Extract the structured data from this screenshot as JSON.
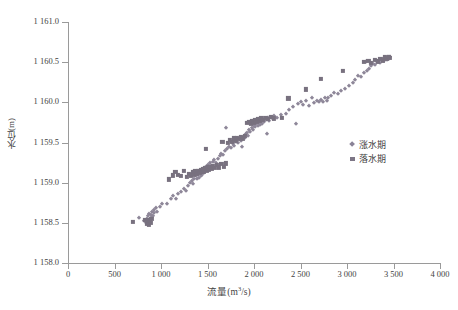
{
  "chart_data": {
    "type": "scatter",
    "title": "",
    "xlabel": "流量(m³/s)",
    "ylabel": "水位(m)",
    "xlim": [
      0,
      4000
    ],
    "ylim": [
      1158.0,
      1161.0
    ],
    "xticks": [
      "0",
      "500",
      "1 000",
      "1 500",
      "2 000",
      "2 500",
      "3 000",
      "3 500",
      "4 000"
    ],
    "xtick_values": [
      0,
      500,
      1000,
      1500,
      2000,
      2500,
      3000,
      3500,
      4000
    ],
    "yticks": [
      "1 158.0",
      "1 158.5",
      "1 159.0",
      "1 159.5",
      "1 160.0",
      "1 160.5",
      "1 161.0"
    ],
    "ytick_values": [
      1158.0,
      1158.5,
      1159.0,
      1159.5,
      1160.0,
      1160.5,
      1161.0
    ],
    "grid": false,
    "legend_position": "right-center",
    "series": [
      {
        "name": "涨水期",
        "marker": "diamond",
        "color": "#8e8799",
        "points": [
          [
            760,
            1158.56
          ],
          [
            820,
            1158.52
          ],
          [
            835,
            1158.5
          ],
          [
            848,
            1158.55
          ],
          [
            858,
            1158.52
          ],
          [
            862,
            1158.58
          ],
          [
            870,
            1158.61
          ],
          [
            876,
            1158.54
          ],
          [
            884,
            1158.53
          ],
          [
            890,
            1158.6
          ],
          [
            898,
            1158.57
          ],
          [
            905,
            1158.63
          ],
          [
            912,
            1158.58
          ],
          [
            920,
            1158.66
          ],
          [
            930,
            1158.62
          ],
          [
            945,
            1158.68
          ],
          [
            960,
            1158.64
          ],
          [
            985,
            1158.7
          ],
          [
            1010,
            1158.74
          ],
          [
            1060,
            1158.73
          ],
          [
            1105,
            1158.8
          ],
          [
            1130,
            1158.84
          ],
          [
            1160,
            1158.8
          ],
          [
            1185,
            1158.86
          ],
          [
            1215,
            1158.88
          ],
          [
            1245,
            1158.92
          ],
          [
            1268,
            1158.9
          ],
          [
            1290,
            1158.96
          ],
          [
            1310,
            1159.0
          ],
          [
            1330,
            1159.02
          ],
          [
            1345,
            1158.98
          ],
          [
            1360,
            1159.05
          ],
          [
            1375,
            1159.08
          ],
          [
            1390,
            1159.04
          ],
          [
            1402,
            1159.1
          ],
          [
            1412,
            1159.06
          ],
          [
            1420,
            1159.12
          ],
          [
            1428,
            1159.08
          ],
          [
            1436,
            1159.14
          ],
          [
            1444,
            1159.1
          ],
          [
            1452,
            1159.16
          ],
          [
            1460,
            1159.12
          ],
          [
            1468,
            1159.18
          ],
          [
            1476,
            1159.14
          ],
          [
            1484,
            1159.2
          ],
          [
            1492,
            1159.17
          ],
          [
            1500,
            1159.22
          ],
          [
            1512,
            1159.19
          ],
          [
            1525,
            1159.24
          ],
          [
            1540,
            1159.21
          ],
          [
            1555,
            1159.26
          ],
          [
            1572,
            1159.28
          ],
          [
            1590,
            1159.25
          ],
          [
            1610,
            1159.3
          ],
          [
            1630,
            1159.33
          ],
          [
            1650,
            1159.36
          ],
          [
            1670,
            1159.34
          ],
          [
            1690,
            1159.39
          ],
          [
            1700,
            1159.68
          ],
          [
            1712,
            1159.42
          ],
          [
            1730,
            1159.45
          ],
          [
            1752,
            1159.43
          ],
          [
            1772,
            1159.48
          ],
          [
            1790,
            1159.46
          ],
          [
            1808,
            1159.51
          ],
          [
            1825,
            1159.49
          ],
          [
            1842,
            1159.54
          ],
          [
            1858,
            1159.52
          ],
          [
            1872,
            1159.44
          ],
          [
            1888,
            1159.57
          ],
          [
            1900,
            1159.55
          ],
          [
            1912,
            1159.6
          ],
          [
            1925,
            1159.62
          ],
          [
            1938,
            1159.58
          ],
          [
            1950,
            1159.65
          ],
          [
            1962,
            1159.63
          ],
          [
            1975,
            1159.68
          ],
          [
            1988,
            1159.66
          ],
          [
            2000,
            1159.71
          ],
          [
            2012,
            1159.69
          ],
          [
            2025,
            1159.73
          ],
          [
            2038,
            1159.7
          ],
          [
            2050,
            1159.74
          ],
          [
            2062,
            1159.72
          ],
          [
            2075,
            1159.76
          ],
          [
            2088,
            1159.73
          ],
          [
            2100,
            1159.77
          ],
          [
            2112,
            1159.75
          ],
          [
            2125,
            1159.78
          ],
          [
            2140,
            1159.6
          ],
          [
            2150,
            1159.8
          ],
          [
            2165,
            1159.77
          ],
          [
            2180,
            1159.81
          ],
          [
            2200,
            1159.79
          ],
          [
            2220,
            1159.83
          ],
          [
            2250,
            1159.8
          ],
          [
            2290,
            1159.84
          ],
          [
            2340,
            1159.86
          ],
          [
            2380,
            1159.9
          ],
          [
            2420,
            1159.94
          ],
          [
            2450,
            1159.73
          ],
          [
            2470,
            1159.98
          ],
          [
            2500,
            1160.0
          ],
          [
            2530,
            1159.97
          ],
          [
            2560,
            1160.02
          ],
          [
            2590,
            1159.96
          ],
          [
            2620,
            1160.05
          ],
          [
            2650,
            1159.99
          ],
          [
            2680,
            1160.02
          ],
          [
            2700,
            1160.0
          ],
          [
            2720,
            1160.03
          ],
          [
            2740,
            1160.01
          ],
          [
            2760,
            1160.05
          ],
          [
            2780,
            1160.02
          ],
          [
            2800,
            1160.06
          ],
          [
            2830,
            1160.08
          ],
          [
            2860,
            1160.11
          ],
          [
            2900,
            1160.1
          ],
          [
            2940,
            1160.14
          ],
          [
            2980,
            1160.16
          ],
          [
            3020,
            1160.2
          ],
          [
            3060,
            1160.24
          ],
          [
            3090,
            1160.28
          ],
          [
            3120,
            1160.33
          ],
          [
            3150,
            1160.31
          ],
          [
            3180,
            1160.36
          ],
          [
            3200,
            1160.5
          ],
          [
            3215,
            1160.39
          ],
          [
            3240,
            1160.42
          ],
          [
            3260,
            1160.45
          ],
          [
            3280,
            1160.48
          ],
          [
            3300,
            1160.46
          ],
          [
            3320,
            1160.5
          ],
          [
            3340,
            1160.52
          ],
          [
            3360,
            1160.49
          ],
          [
            3380,
            1160.53
          ],
          [
            3395,
            1160.51
          ],
          [
            3410,
            1160.55
          ],
          [
            3425,
            1160.53
          ],
          [
            3440,
            1160.56
          ],
          [
            3455,
            1160.54
          ],
          [
            3465,
            1160.57
          ]
        ]
      },
      {
        "name": "落水期",
        "marker": "square",
        "color": "#78717f",
        "points": [
          [
            700,
            1158.51
          ],
          [
            830,
            1158.54
          ],
          [
            848,
            1158.49
          ],
          [
            858,
            1158.53
          ],
          [
            868,
            1158.48
          ],
          [
            878,
            1158.52
          ],
          [
            888,
            1158.5
          ],
          [
            896,
            1158.55
          ],
          [
            1085,
            1159.04
          ],
          [
            1130,
            1159.09
          ],
          [
            1155,
            1159.13
          ],
          [
            1180,
            1159.1
          ],
          [
            1215,
            1159.08
          ],
          [
            1250,
            1159.15
          ],
          [
            1280,
            1159.07
          ],
          [
            1300,
            1159.11
          ],
          [
            1320,
            1159.09
          ],
          [
            1340,
            1159.13
          ],
          [
            1355,
            1159.1
          ],
          [
            1370,
            1159.14
          ],
          [
            1385,
            1159.11
          ],
          [
            1400,
            1159.15
          ],
          [
            1415,
            1159.12
          ],
          [
            1430,
            1159.16
          ],
          [
            1442,
            1159.13
          ],
          [
            1455,
            1159.17
          ],
          [
            1465,
            1159.14
          ],
          [
            1475,
            1159.18
          ],
          [
            1480,
            1159.42
          ],
          [
            1490,
            1159.15
          ],
          [
            1500,
            1159.19
          ],
          [
            1515,
            1159.16
          ],
          [
            1530,
            1159.2
          ],
          [
            1545,
            1159.17
          ],
          [
            1560,
            1159.21
          ],
          [
            1580,
            1159.18
          ],
          [
            1600,
            1159.22
          ],
          [
            1625,
            1159.19
          ],
          [
            1650,
            1159.23
          ],
          [
            1660,
            1159.51
          ],
          [
            1680,
            1159.2
          ],
          [
            1700,
            1159.24
          ],
          [
            1720,
            1159.5
          ],
          [
            1740,
            1159.53
          ],
          [
            1760,
            1159.51
          ],
          [
            1780,
            1159.55
          ],
          [
            1800,
            1159.52
          ],
          [
            1820,
            1159.56
          ],
          [
            1840,
            1159.54
          ],
          [
            1860,
            1159.57
          ],
          [
            1880,
            1159.55
          ],
          [
            1900,
            1159.58
          ],
          [
            1930,
            1159.74
          ],
          [
            1950,
            1159.76
          ],
          [
            1965,
            1159.73
          ],
          [
            1980,
            1159.77
          ],
          [
            1995,
            1159.75
          ],
          [
            2010,
            1159.78
          ],
          [
            2025,
            1159.76
          ],
          [
            2040,
            1159.79
          ],
          [
            2060,
            1159.77
          ],
          [
            2080,
            1159.8
          ],
          [
            2100,
            1159.78
          ],
          [
            2125,
            1159.81
          ],
          [
            2150,
            1159.79
          ],
          [
            2180,
            1159.82
          ],
          [
            2215,
            1159.8
          ],
          [
            2300,
            1159.81
          ],
          [
            2370,
            1160.05
          ],
          [
            2560,
            1160.16
          ],
          [
            2720,
            1160.29
          ],
          [
            2960,
            1160.39
          ],
          [
            3180,
            1160.5
          ],
          [
            3230,
            1160.52
          ],
          [
            3260,
            1160.49
          ],
          [
            3300,
            1160.53
          ],
          [
            3330,
            1160.51
          ],
          [
            3360,
            1160.54
          ],
          [
            3390,
            1160.52
          ],
          [
            3410,
            1160.56
          ],
          [
            3430,
            1160.54
          ],
          [
            3450,
            1160.57
          ],
          [
            3462,
            1160.55
          ]
        ]
      }
    ]
  },
  "legend": {
    "items": [
      {
        "label": "涨水期",
        "marker": "diamond"
      },
      {
        "label": "落水期",
        "marker": "square"
      }
    ]
  },
  "axes": {
    "y_title": "水位(m)",
    "x_title_main": "流量(m",
    "x_title_sup": "3",
    "x_title_tail": "/s)"
  },
  "caption": {
    "text": ""
  }
}
